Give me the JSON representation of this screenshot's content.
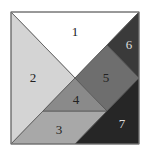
{
  "diagram": {
    "type": "tangram-square",
    "pieces": [
      {
        "label": "1",
        "fill": "#ffffff",
        "text_color": "#222222",
        "points": "11,12 139,12 75,78",
        "label_x": 75,
        "label_y": 33
      },
      {
        "label": "2",
        "fill": "#d4d4d4",
        "text_color": "#222222",
        "points": "11,12 11,144 75,78",
        "label_x": 33,
        "label_y": 79
      },
      {
        "label": "3",
        "fill": "#a8a8a8",
        "text_color": "#222222",
        "points": "43,111 107,111 75,144 11,144",
        "label_x": 59,
        "label_y": 131
      },
      {
        "label": "4",
        "fill": "#8a8a8a",
        "text_color": "#222222",
        "points": "75,78 107,111 43,111",
        "label_x": 76,
        "label_y": 101
      },
      {
        "label": "5",
        "fill": "#6e6e6e",
        "text_color": "#222222",
        "points": "75,78 107,45 139,78 107,111",
        "label_x": 106,
        "label_y": 79
      },
      {
        "label": "6",
        "fill": "#3a3a3a",
        "text_color": "#dddddd",
        "points": "139,12 139,78 107,45",
        "label_x": 129,
        "label_y": 46
      },
      {
        "label": "7",
        "fill": "#262626",
        "text_color": "#dddddd",
        "points": "139,78 139,144 75,144 107,111",
        "label_x": 122,
        "label_y": 125
      }
    ],
    "stroke": "#555555"
  }
}
